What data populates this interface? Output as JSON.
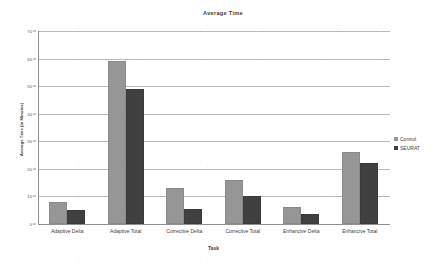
{
  "chart_data": {
    "type": "bar",
    "title": "Average Time",
    "xlabel": "Task",
    "ylabel": "Average Time (in Minutes)",
    "categories": [
      "Adaptive Delta",
      "Adaptive Total",
      "Corrective Delta",
      "Corrective Total",
      "Enhancive Delta",
      "Enhancive Total"
    ],
    "series": [
      {
        "name": "Control",
        "color": "#969696",
        "values": [
          8,
          59,
          13,
          16,
          6,
          26
        ]
      },
      {
        "name": "SEURAT",
        "color": "#404040",
        "values": [
          5,
          49,
          5.5,
          10,
          3.5,
          22
        ]
      }
    ],
    "ylim": [
      0,
      70
    ],
    "ytick_labels": [
      "70",
      "60",
      "50",
      "40",
      "30",
      "20",
      "10",
      "0"
    ],
    "ytick_values": [
      70,
      60,
      50,
      40,
      30,
      20,
      10,
      0
    ],
    "grid": true,
    "legend_position": "right"
  }
}
